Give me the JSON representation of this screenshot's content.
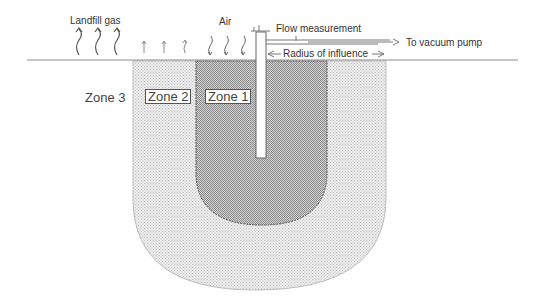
{
  "diagram": {
    "type": "landfill gas extraction well zones of influence",
    "labels": {
      "landfill_gas": "Landfill gas",
      "air": "Air",
      "flow_measurement": "Flow measurement",
      "to_vacuum_pump": "To vacuum pump",
      "radius_of_influence": "Radius of influence"
    },
    "zones": [
      {
        "id": "zone1",
        "label": "Zone 1",
        "fill": "#b5b5b5"
      },
      {
        "id": "zone2",
        "label": "Zone 2",
        "fill": "#e0e0e0"
      },
      {
        "id": "zone3",
        "label": "Zone 3",
        "fill": "#e6e6e6"
      }
    ],
    "colors": {
      "line": "#8a8a8a",
      "outline": "#555555",
      "text": "#333333"
    }
  }
}
